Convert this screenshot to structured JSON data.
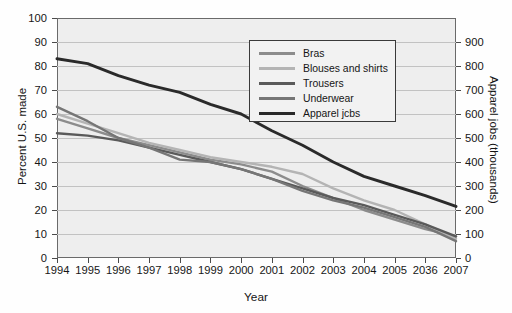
{
  "chart_data": {
    "type": "line",
    "title": "",
    "xlabel": "Year",
    "ylabel": "Percent U.S. made",
    "ylabel_right": "Apparel jobs (thousands)",
    "x": [
      1994,
      1995,
      1996,
      1997,
      1998,
      1999,
      2000,
      2001,
      2002,
      2003,
      2004,
      2005,
      2006,
      2007
    ],
    "categories": [
      "1994",
      "1995",
      "1996",
      "1997",
      "1998",
      "1999",
      "2000",
      "2001",
      "2002",
      "2003",
      "2004",
      "2005",
      "2006",
      "2007"
    ],
    "ylim": [
      0,
      100
    ],
    "yticks": [
      0,
      10,
      20,
      30,
      40,
      50,
      60,
      70,
      80,
      90,
      100
    ],
    "ylim_right": [
      0,
      1000
    ],
    "yticks_right": [
      0,
      100,
      200,
      300,
      400,
      500,
      600,
      700,
      800,
      900
    ],
    "grid": true,
    "legend_position": "top-right",
    "series": [
      {
        "name": "Bras",
        "axis": "left",
        "color": "#8c8c8c",
        "values": [
          58,
          54,
          50,
          47,
          44,
          41,
          39,
          36,
          30,
          25,
          20,
          16,
          12,
          9
        ]
      },
      {
        "name": "Blouses and shirts",
        "axis": "left",
        "color": "#b4b4b4",
        "values": [
          60,
          56,
          52,
          48,
          45,
          42,
          40,
          38,
          35,
          29,
          24,
          20,
          14,
          8
        ]
      },
      {
        "name": "Trousers",
        "axis": "left",
        "color": "#5a5a5a",
        "values": [
          52,
          51,
          49,
          46,
          43,
          40,
          37,
          33,
          29,
          25,
          22,
          18,
          14,
          9
        ]
      },
      {
        "name": "Underwear",
        "axis": "left",
        "color": "#767676",
        "values": [
          63,
          57,
          50,
          46,
          41,
          40,
          37,
          33,
          28,
          24,
          21,
          17,
          13,
          7
        ]
      },
      {
        "name": "Apparel jobs",
        "axis": "right",
        "color": "#2a2a2a",
        "values": [
          830,
          810,
          760,
          720,
          690,
          640,
          600,
          530,
          470,
          400,
          340,
          300,
          260,
          215
        ]
      }
    ]
  },
  "legend": {
    "items": [
      {
        "label": "Bras",
        "color": "#8c8c8c"
      },
      {
        "label": "Blouses and shirts",
        "color": "#b4b4b4"
      },
      {
        "label": "Trousers",
        "color": "#5a5a5a"
      },
      {
        "label": "Underwear",
        "color": "#767676"
      },
      {
        "label": "Apparel jcbs",
        "color": "#2a2a2a"
      }
    ]
  },
  "axes": {
    "left": {
      "title": "Percent U.S. made",
      "ticks": [
        "100",
        "90",
        "80",
        "70",
        "60",
        "50",
        "40",
        "30",
        "20",
        "10",
        "0"
      ]
    },
    "right": {
      "title": "Apparel jobs (thousands)",
      "ticks": [
        "900",
        "800",
        "700",
        "600",
        "500",
        "400",
        "300",
        "200",
        "100",
        "0"
      ]
    },
    "bottom": {
      "title": "Year",
      "ticks": [
        "1994",
        "1995",
        "1996",
        "1997",
        "1998",
        "1999",
        "2000",
        "2001",
        "2002",
        "2003",
        "2004",
        "2005",
        "2036",
        "2007"
      ]
    }
  }
}
